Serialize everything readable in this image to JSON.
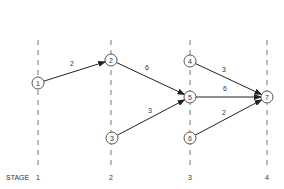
{
  "diagram": {
    "type": "staged network",
    "stage_label": "STAGE",
    "stages": [
      {
        "id": 1,
        "label": "1",
        "x": 38
      },
      {
        "id": 2,
        "label": "2",
        "x": 111
      },
      {
        "id": 3,
        "label": "3",
        "x": 190
      },
      {
        "id": 4,
        "label": "4",
        "x": 267
      }
    ],
    "nodes": [
      {
        "id": "1",
        "label": "1",
        "stage": 1,
        "x": 38,
        "y": 83
      },
      {
        "id": "2",
        "label": "2",
        "stage": 2,
        "x": 111,
        "y": 60
      },
      {
        "id": "3",
        "label": "3",
        "stage": 2,
        "x": 112,
        "y": 138
      },
      {
        "id": "4",
        "label": "4",
        "stage": 3,
        "x": 190,
        "y": 61
      },
      {
        "id": "5",
        "label": "5",
        "stage": 3,
        "x": 190,
        "y": 97
      },
      {
        "id": "6",
        "label": "6",
        "stage": 3,
        "x": 190,
        "y": 138
      },
      {
        "id": "7",
        "label": "7",
        "stage": 4,
        "x": 267,
        "y": 97
      }
    ],
    "edges": [
      {
        "from": "1",
        "to": "2",
        "weight": "2",
        "lx": 72,
        "ly": 66
      },
      {
        "from": "2",
        "to": "5",
        "weight": "6",
        "lx": 147,
        "ly": 70
      },
      {
        "from": "3",
        "to": "5",
        "weight": "3",
        "lx": 150,
        "ly": 113
      },
      {
        "from": "4",
        "to": "7",
        "weight": "3",
        "lx": 224,
        "ly": 72
      },
      {
        "from": "5",
        "to": "7",
        "weight": "6",
        "lx": 225,
        "ly": 91
      },
      {
        "from": "6",
        "to": "7",
        "weight": "2",
        "lx": 224,
        "ly": 115
      }
    ],
    "colors": {
      "line": "#222222",
      "dash": "#555555",
      "text": "#333333"
    }
  }
}
